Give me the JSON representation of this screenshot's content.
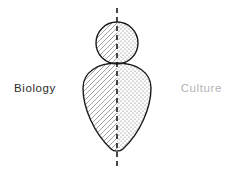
{
  "canvas": {
    "width": 232,
    "height": 172,
    "background_color": "#ffffff"
  },
  "diagram": {
    "stroke_color": "#1a1a1a",
    "stroke_width": 1.4,
    "axis": {
      "name": "vertical-dashed-midline",
      "x": 117,
      "y_start": 8,
      "y_end": 166,
      "dash_pattern": "5 4",
      "color": "#1a1a1a",
      "width": 1.6
    },
    "head": {
      "shape": "circle",
      "center_x": 117,
      "center_y": 43,
      "radius": 21,
      "left_fill": "diagonal-hatch",
      "right_fill": "dotted-stipple"
    },
    "body": {
      "shape": "inverted-teardrop",
      "top_y": 63,
      "bottom_y": 152,
      "left_x": 83,
      "right_x": 151,
      "widest_y": 84,
      "left_fill": "diagonal-hatch",
      "right_fill": "dotted-stipple"
    },
    "patterns": {
      "hatch": {
        "name": "diagonal-hatch",
        "direction": "lower-left-to-upper-right",
        "spacing": 5,
        "line_color": "#7a7a7a",
        "line_width": 0.7
      },
      "stipple": {
        "name": "dotted-stipple",
        "spacing": 4,
        "dot_radius": 0.62,
        "dot_color": "#6e6e6e"
      }
    }
  },
  "labels": {
    "left": {
      "text": "Biology",
      "color": "#2b2b2b"
    },
    "right": {
      "text": "Culture",
      "color": "#b4b4b4"
    }
  }
}
